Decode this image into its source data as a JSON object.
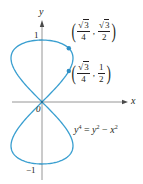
{
  "chart_data": {
    "type": "line",
    "title": "",
    "xlabel": "x",
    "ylabel": "y",
    "equation": "y^4 = y^2 - x^2",
    "equation_parts": {
      "lhs_base": "y",
      "lhs_exp": "4",
      "eq": " = ",
      "t1_base": "y",
      "t1_exp": "2",
      "minus": " − ",
      "t2_base": "x",
      "t2_exp": "2"
    },
    "curve": "parametric figure-eight: x = ±y·sqrt(1 − y²), y ∈ [−1, 1]",
    "xlim": [
      -0.65,
      1.35
    ],
    "ylim": [
      -1.2,
      1.3
    ],
    "y_ticks": [
      {
        "value": 1,
        "label": "1"
      },
      {
        "value": -1,
        "label": "−1"
      }
    ],
    "origin_label": "0",
    "grid": false,
    "legend": null,
    "highlighted_points": [
      {
        "x": 0.433,
        "y": 0.866,
        "label_x_num": "3",
        "label_x_den": "4",
        "label_y_num": "3",
        "label_y_den": "2",
        "x_text": "√3/4",
        "y_text": "√3/2"
      },
      {
        "x": 0.433,
        "y": 0.5,
        "label_x_num": "3",
        "label_x_den": "4",
        "label_y_num": "1",
        "label_y_den": "2",
        "x_text": "√3/4",
        "y_text": "1/2"
      }
    ],
    "sample_points": [
      {
        "x": 0,
        "y": 0
      },
      {
        "x": 0.199,
        "y": 0.2
      },
      {
        "x": 0.367,
        "y": 0.4
      },
      {
        "x": 0.5,
        "y": 0.707
      },
      {
        "x": 0.48,
        "y": 0.8
      },
      {
        "x": 0.392,
        "y": 0.9
      },
      {
        "x": 0,
        "y": 1
      },
      {
        "x": -0.5,
        "y": 0.707
      },
      {
        "x": 0,
        "y": -1
      },
      {
        "x": 0.5,
        "y": -0.707
      },
      {
        "x": -0.5,
        "y": -0.707
      }
    ]
  },
  "colors": {
    "curve": "#3a9fd0",
    "axis": "#7a7a7a",
    "text": "#231f20",
    "points": "#2f8fc6"
  },
  "labels": {
    "x_axis": "x",
    "y_axis": "y",
    "origin": "0",
    "y_tick_pos": "1",
    "y_tick_neg": "−1",
    "sqrt_sign": "√",
    "comma": ",",
    "lparen": "(",
    "rparen": ")"
  }
}
